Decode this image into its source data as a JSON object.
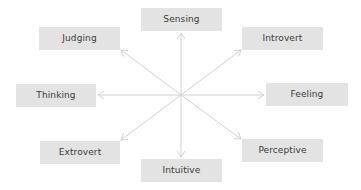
{
  "diagram": {
    "type": "radial-arrows",
    "center": {
      "x": 181,
      "y": 95
    },
    "colors": {
      "box_fill": "#e3e3e3",
      "text": "#3b3b3b",
      "arrow": "#d2d2d2",
      "background": "#ffffff"
    },
    "nodes": [
      {
        "id": "sensing",
        "label": "Sensing",
        "x": 141,
        "y": 8,
        "w": 81,
        "h": 23,
        "arrow_to": {
          "x": 181,
          "y": 33
        }
      },
      {
        "id": "introvert",
        "label": "Introvert",
        "x": 242,
        "y": 27,
        "w": 81,
        "h": 23,
        "arrow_to": {
          "x": 241,
          "y": 50
        }
      },
      {
        "id": "feeling",
        "label": "Feeling",
        "x": 266,
        "y": 83,
        "w": 82,
        "h": 23,
        "arrow_to": {
          "x": 264,
          "y": 95
        }
      },
      {
        "id": "perceptive",
        "label": "Perceptive",
        "x": 242,
        "y": 139,
        "w": 81,
        "h": 23,
        "arrow_to": {
          "x": 241,
          "y": 139
        }
      },
      {
        "id": "intuitive",
        "label": "Intuitive",
        "x": 141,
        "y": 159,
        "w": 81,
        "h": 23,
        "arrow_to": {
          "x": 181,
          "y": 157
        }
      },
      {
        "id": "extrovert",
        "label": "Extrovert",
        "x": 40,
        "y": 141,
        "w": 80,
        "h": 23,
        "arrow_to": {
          "x": 121,
          "y": 140
        }
      },
      {
        "id": "thinking",
        "label": "Thinking",
        "x": 16,
        "y": 84,
        "w": 80,
        "h": 23,
        "arrow_to": {
          "x": 98,
          "y": 95
        }
      },
      {
        "id": "judging",
        "label": "Judging",
        "x": 39,
        "y": 27,
        "w": 81,
        "h": 23,
        "arrow_to": {
          "x": 121,
          "y": 50
        }
      }
    ]
  }
}
